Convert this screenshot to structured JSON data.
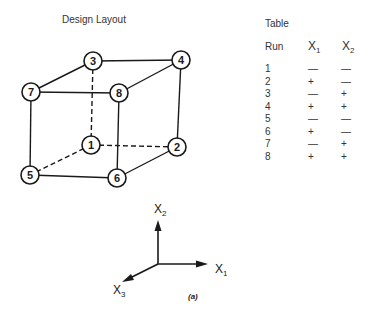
{
  "design_layout": {
    "title": "Design Layout",
    "nodes": [
      {
        "id": "1",
        "label": "1",
        "x": 91,
        "y": 145
      },
      {
        "id": "2",
        "label": "2",
        "x": 177,
        "y": 147
      },
      {
        "id": "3",
        "label": "3",
        "x": 93,
        "y": 61
      },
      {
        "id": "4",
        "label": "4",
        "x": 181,
        "y": 60
      },
      {
        "id": "5",
        "label": "5",
        "x": 30,
        "y": 175
      },
      {
        "id": "6",
        "label": "6",
        "x": 117,
        "y": 178
      },
      {
        "id": "7",
        "label": "7",
        "x": 31,
        "y": 92
      },
      {
        "id": "8",
        "label": "8",
        "x": 119,
        "y": 93
      }
    ],
    "edges": [
      {
        "from": "3",
        "to": "4",
        "style": "solid"
      },
      {
        "from": "7",
        "to": "8",
        "style": "solid"
      },
      {
        "from": "3",
        "to": "7",
        "style": "solid"
      },
      {
        "from": "4",
        "to": "8",
        "style": "solid"
      },
      {
        "from": "7",
        "to": "5",
        "style": "solid"
      },
      {
        "from": "8",
        "to": "6",
        "style": "solid"
      },
      {
        "from": "4",
        "to": "2",
        "style": "solid"
      },
      {
        "from": "5",
        "to": "6",
        "style": "solid"
      },
      {
        "from": "6",
        "to": "2",
        "style": "solid"
      },
      {
        "from": "3",
        "to": "1",
        "style": "dashed"
      },
      {
        "from": "1",
        "to": "2",
        "style": "dashed"
      },
      {
        "from": "1",
        "to": "5",
        "style": "dashed"
      }
    ]
  },
  "table": {
    "title": "Table",
    "headers": {
      "run": "Run",
      "x1_base": "X",
      "x1_sub": "1",
      "x2_base": "X",
      "x2_sub": "2"
    },
    "rows": [
      {
        "run": "1",
        "x1": "—",
        "x2": "—"
      },
      {
        "run": "2",
        "x1": "+",
        "x2": "—"
      },
      {
        "run": "3",
        "x1": "—",
        "x2": "+"
      },
      {
        "run": "4",
        "x1": "+",
        "x2": "+"
      },
      {
        "run": "5",
        "x1": "—",
        "x2": "—"
      },
      {
        "run": "6",
        "x1": "+",
        "x2": "—"
      },
      {
        "run": "7",
        "x1": "—",
        "x2": "+"
      },
      {
        "run": "8",
        "x1": "+",
        "x2": "+"
      }
    ]
  },
  "axes": {
    "x1": {
      "base": "X",
      "sub": "1"
    },
    "x2": {
      "base": "X",
      "sub": "2"
    },
    "x3": {
      "base": "X",
      "sub": "3"
    }
  },
  "caption": "(a)"
}
